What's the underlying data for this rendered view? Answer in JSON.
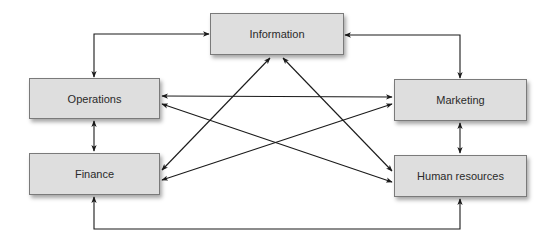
{
  "diagram": {
    "type": "flowchart",
    "nodes": [
      {
        "id": "information",
        "label": "Information",
        "x": 210,
        "y": 13,
        "w": 134,
        "h": 42
      },
      {
        "id": "operations",
        "label": "Operations",
        "x": 29,
        "y": 78,
        "w": 131,
        "h": 41
      },
      {
        "id": "finance",
        "label": "Finance",
        "x": 29,
        "y": 153,
        "w": 131,
        "h": 42
      },
      {
        "id": "marketing",
        "label": "Marketing",
        "x": 394,
        "y": 79,
        "w": 133,
        "h": 42
      },
      {
        "id": "human_resources",
        "label": "Human resources",
        "x": 394,
        "y": 155,
        "w": 133,
        "h": 42
      }
    ],
    "edges": [
      {
        "from": "operations",
        "to": "information",
        "bidirectional": true
      },
      {
        "from": "information",
        "to": "marketing",
        "bidirectional": true
      },
      {
        "from": "operations",
        "to": "finance",
        "bidirectional": true
      },
      {
        "from": "marketing",
        "to": "human_resources",
        "bidirectional": true
      },
      {
        "from": "finance",
        "to": "human_resources",
        "bidirectional": true
      },
      {
        "from": "operations",
        "to": "marketing",
        "bidirectional": true
      },
      {
        "from": "operations",
        "to": "human_resources",
        "bidirectional": true
      },
      {
        "from": "finance",
        "to": "information",
        "bidirectional": true
      },
      {
        "from": "finance",
        "to": "marketing",
        "bidirectional": true
      },
      {
        "from": "information",
        "to": "human_resources",
        "bidirectional": true
      }
    ],
    "colors": {
      "box_fill": "#dedede",
      "box_border": "#7a7a7a",
      "line": "#1a1a1a",
      "text": "#2a2a2a"
    }
  }
}
